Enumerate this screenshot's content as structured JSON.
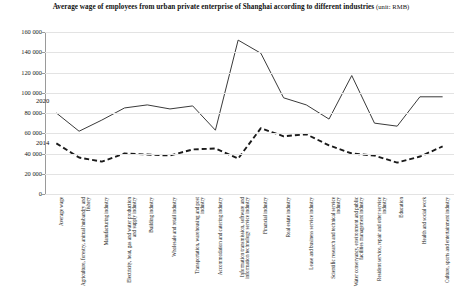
{
  "chart_data": {
    "type": "line",
    "title": "Average wage of employees from urban private enterprise of Shanghai according to different industries",
    "title_unit": "(unit: RMB)",
    "xlabel": "",
    "ylabel": "",
    "ylim": [
      0,
      160000
    ],
    "ytick_labels": [
      "160 000",
      "140 000",
      "120 000",
      "100 000",
      "80 000",
      "60 000",
      "40 000",
      "20 000",
      "0"
    ],
    "ytick_values": [
      160000,
      140000,
      120000,
      100000,
      80000,
      60000,
      40000,
      20000,
      0
    ],
    "grid": true,
    "legend_position": "inline",
    "categories": [
      "Average wage",
      "Agriculture, forestry, animal husbandry and fishery",
      "Manufacturing industry",
      "Electricity, heat, gas and water production and supply industry",
      "Building industry",
      "Wholesale and retail industry",
      "Transportation, warehousing and post industry",
      "Accommodation and catering industry",
      "Information transmission, software and information technology service industry",
      "Financial industry",
      "Real estate industry",
      "Lease and business service industry",
      "Scientific research and technical service industry",
      "Water conservancy, environment and public facilities management industry",
      "Resident service, repair and other service industry",
      "Education",
      "Health and social work",
      "Culture, sports and entertainment industry"
    ],
    "series": [
      {
        "name": "2020",
        "style": "solid",
        "color": "#3a3a3a",
        "values": [
          80000,
          62000,
          73000,
          85000,
          88000,
          84000,
          87000,
          63000,
          152000,
          139000,
          95000,
          88000,
          74000,
          117000,
          70000,
          67000,
          96000,
          96000
        ]
      },
      {
        "name": "2014",
        "style": "dashed",
        "color": "#1a1a1a",
        "values": [
          50000,
          36000,
          32000,
          40000,
          39000,
          38000,
          44000,
          45000,
          35000,
          65000,
          57000,
          59000,
          48000,
          40000,
          38000,
          31000,
          37000,
          47000
        ]
      }
    ],
    "series_label_positions": [
      {
        "name": "2020",
        "x": 36,
        "y": 97
      },
      {
        "name": "2014",
        "x": 36,
        "y": 139
      }
    ]
  }
}
